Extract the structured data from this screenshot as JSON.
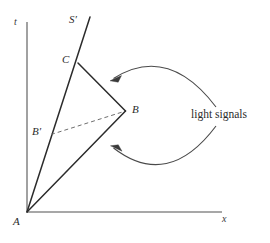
{
  "figure": {
    "type": "spacetime-diagram",
    "background_color": "#ffffff",
    "width": 270,
    "height": 243,
    "axes": {
      "t_label": "t",
      "x_label": "x",
      "origin_label": "A",
      "axis_color": "#8a8a8a",
      "t_axis": {
        "x": 27,
        "y_top": 22,
        "y_bottom": 212
      },
      "x_axis": {
        "y": 212,
        "x_left": 27,
        "x_right": 222
      }
    },
    "labels": {
      "t": "t",
      "x": "x",
      "A": "A",
      "B": "B",
      "B_prime": "B′",
      "C": "C",
      "S_prime": "S′",
      "light_signals": "light signals"
    },
    "points": {
      "A": {
        "x": 27,
        "y": 212
      },
      "B": {
        "x": 125,
        "y": 111
      },
      "B_prime": {
        "x": 52,
        "y": 134
      },
      "C": {
        "x": 78,
        "y": 63
      },
      "S_prime_top": {
        "x": 90,
        "y": 17
      }
    },
    "lines": [
      {
        "name": "worldline-S-prime",
        "from": "A",
        "to": "S_prime_top",
        "style": "solid",
        "color": "#2b2b2b",
        "width": 1.4
      },
      {
        "name": "light-signal-A-to-B",
        "from": "A",
        "to": "B",
        "style": "solid",
        "color": "#2b2b2b",
        "width": 1.4
      },
      {
        "name": "light-signal-B-to-C",
        "from": "B",
        "to": "C",
        "style": "solid",
        "color": "#2b2b2b",
        "width": 1.4
      },
      {
        "name": "simultaneity-line-B-prime-to-B",
        "from": "B_prime",
        "to": "B",
        "style": "dashed",
        "color": "#6f6f6f",
        "width": 1.0
      }
    ],
    "arcs": [
      {
        "name": "upper-light-signal-arc",
        "direction": "leftward",
        "color": "#4a4a4a",
        "start": {
          "x": 216,
          "y": 107
        },
        "control": {
          "x": 168,
          "y": 48
        },
        "end": {
          "x": 112,
          "y": 79
        },
        "arrow_at": "end"
      },
      {
        "name": "lower-light-signal-arc",
        "direction": "leftward",
        "color": "#4a4a4a",
        "start": {
          "x": 216,
          "y": 126
        },
        "control": {
          "x": 168,
          "y": 186
        },
        "end": {
          "x": 112,
          "y": 148
        },
        "arrow_at": "end"
      }
    ]
  }
}
